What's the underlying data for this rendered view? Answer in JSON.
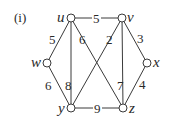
{
  "figure": {
    "tag": "(i)",
    "nodes": [
      {
        "id": "u",
        "label": "u",
        "x": 71,
        "y": 18
      },
      {
        "id": "v",
        "label": "v",
        "x": 122,
        "y": 18
      },
      {
        "id": "w",
        "label": "w",
        "x": 47,
        "y": 63
      },
      {
        "id": "x",
        "label": "x",
        "x": 147,
        "y": 63
      },
      {
        "id": "y",
        "label": "y",
        "x": 71,
        "y": 108
      },
      {
        "id": "z",
        "label": "z",
        "x": 123,
        "y": 108
      }
    ],
    "edges": [
      {
        "from": "u",
        "to": "v",
        "weight": "5"
      },
      {
        "from": "u",
        "to": "w",
        "weight": "5"
      },
      {
        "from": "u",
        "to": "y",
        "weight": "8"
      },
      {
        "from": "u",
        "to": "z",
        "weight": "6"
      },
      {
        "from": "v",
        "to": "y",
        "weight": "2"
      },
      {
        "from": "v",
        "to": "z",
        "weight": "7"
      },
      {
        "from": "v",
        "to": "x",
        "weight": "3"
      },
      {
        "from": "w",
        "to": "y",
        "weight": "6"
      },
      {
        "from": "x",
        "to": "z",
        "weight": "4"
      },
      {
        "from": "y",
        "to": "z",
        "weight": "9"
      }
    ]
  }
}
